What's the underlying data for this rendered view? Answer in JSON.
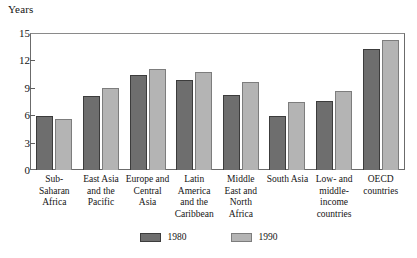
{
  "chart_data": {
    "type": "bar",
    "title": "",
    "ylabel": "Years",
    "xlabel": "",
    "ylim": [
      0,
      15
    ],
    "yticks": [
      0,
      3,
      6,
      9,
      12,
      15
    ],
    "grid": false,
    "legend_position": "bottom-center",
    "categories": [
      "Sub-Saharan Africa",
      "East Asia and the Pacific",
      "Europe and Central Asia",
      "Latin America and the Caribbean",
      "Middle East and North Africa",
      "South Asia",
      "Low- and middle-income countries",
      "OECD countries"
    ],
    "series": [
      {
        "name": "1980",
        "color": "#6e6e6e",
        "values": [
          5.9,
          8.1,
          10.4,
          9.9,
          8.2,
          5.9,
          7.6,
          13.3
        ]
      },
      {
        "name": "1990",
        "color": "#b4b4b4",
        "values": [
          5.6,
          9.0,
          11.1,
          10.7,
          9.6,
          7.5,
          8.6,
          14.2
        ]
      }
    ]
  },
  "legend": {
    "items": [
      {
        "label": "1980",
        "color": "#6e6e6e"
      },
      {
        "label": "1990",
        "color": "#b4b4b4"
      }
    ]
  }
}
